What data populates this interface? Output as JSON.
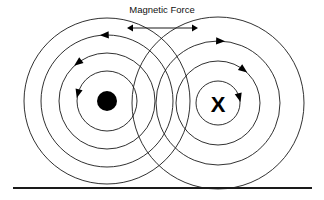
{
  "diagram": {
    "title": "Magnetic Force",
    "background_color": "#ffffff",
    "stroke_color": "#1a1a1a",
    "fill_color": "#000000",
    "width": 324,
    "height": 200
  },
  "force_arrow": {
    "label": "force-span-arrow",
    "x_start": 127,
    "x_end": 198,
    "y": 28,
    "double_headed": true
  },
  "ground": {
    "label": "ground-line",
    "x_start": 13,
    "x_end": 312,
    "y": 188
  },
  "conductors": [
    {
      "id": "left-conductor",
      "symbol": "dot",
      "symbol_label": "current-out-of-page",
      "center_x": 107,
      "center_y": 101,
      "dot_radius": 10,
      "field_direction": "counterclockwise",
      "circle_radii": [
        30,
        48,
        66,
        83
      ],
      "arrow_angles_deg": [
        195,
        233,
        268
      ]
    },
    {
      "id": "right-conductor",
      "symbol": "X",
      "symbol_label": "current-into-page",
      "center_x": 218,
      "center_y": 103,
      "field_direction": "clockwise",
      "circle_radii": [
        22,
        42,
        62,
        86
      ],
      "arrow_angles_deg": [
        -15,
        -53,
        -88
      ]
    }
  ]
}
